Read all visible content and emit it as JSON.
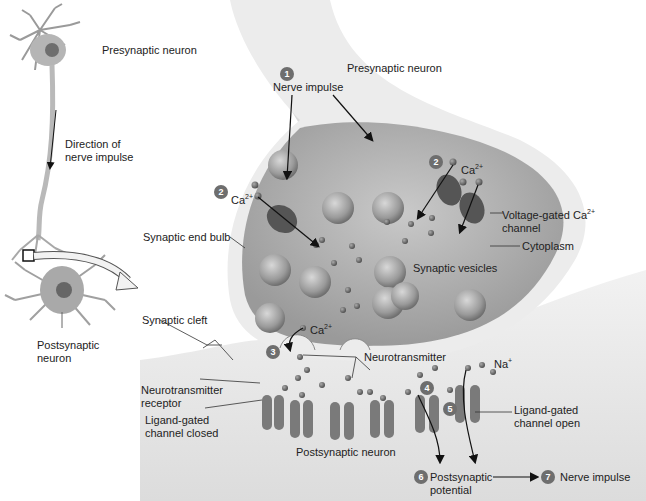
{
  "overview": {
    "presynaptic_label": "Presynaptic neuron",
    "direction_label_1": "Direction of",
    "direction_label_2": "nerve impulse",
    "postsynaptic_label_1": "Postsynaptic",
    "postsynaptic_label_2": "neuron"
  },
  "detail": {
    "presynaptic_neuron": "Presynaptic neuron",
    "synaptic_end_bulb": "Synaptic end bulb",
    "synaptic_vesicles": "Synaptic vesicles",
    "cytoplasm": "Cytoplasm",
    "vg_channel_1": "Voltage-gated Ca",
    "vg_channel_sup": "2+",
    "vg_channel_2": "channel",
    "synaptic_cleft": "Synaptic cleft",
    "neurotransmitter": "Neurotransmitter",
    "nt_receptor_1": "Neurotransmitter",
    "nt_receptor_2": "receptor",
    "lg_closed_1": "Ligand-gated",
    "lg_closed_2": "channel closed",
    "lg_open_1": "Ligand-gated",
    "lg_open_2": "channel open",
    "postsynaptic_neuron": "Postsynaptic neuron",
    "ca_ion": "Ca",
    "ca_sup": "2+",
    "na_ion": "Na",
    "na_sup": "+"
  },
  "steps": [
    {
      "num": "1",
      "label": "Nerve impulse"
    },
    {
      "num": "2",
      "label": "Ca2+ influx"
    },
    {
      "num": "3",
      "label": "Exocytosis"
    },
    {
      "num": "4",
      "label": "Binding"
    },
    {
      "num": "5",
      "label": "Channel opens"
    },
    {
      "num": "6",
      "label_1": "Postsynaptic",
      "label_2": "potential"
    },
    {
      "num": "7",
      "label": "Nerve impulse"
    }
  ]
}
